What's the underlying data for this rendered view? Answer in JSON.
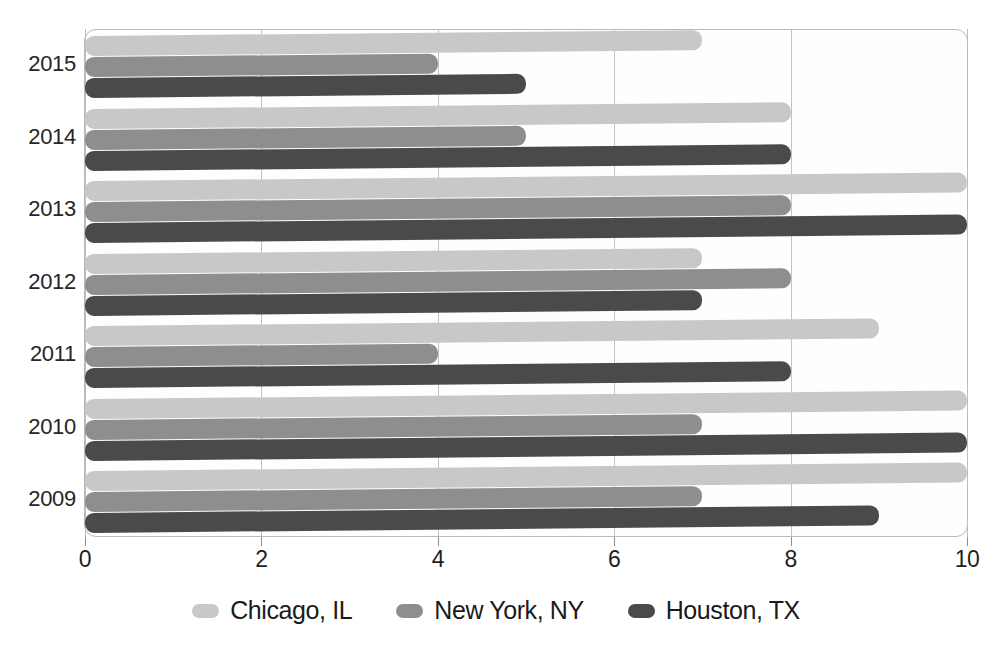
{
  "chart_data": {
    "type": "bar",
    "orientation": "horizontal",
    "title": "",
    "xlabel": "",
    "ylabel": "",
    "xlim": [
      0,
      10
    ],
    "xticks": [
      "0",
      "2",
      "4",
      "6",
      "8",
      "10"
    ],
    "grid": true,
    "legend_position": "bottom",
    "categories": [
      "2015",
      "2014",
      "2013",
      "2012",
      "2011",
      "2010",
      "2009"
    ],
    "series": [
      {
        "name": "Chicago, IL",
        "color": "#c8c8c8",
        "values": [
          7,
          8,
          10,
          7,
          9,
          10,
          10
        ]
      },
      {
        "name": "New York, NY",
        "color": "#8e8e8e",
        "values": [
          4,
          5,
          8,
          8,
          4,
          7,
          7
        ]
      },
      {
        "name": "Houston, TX",
        "color": "#4a4a4a",
        "values": [
          5,
          8,
          10,
          7,
          8,
          10,
          9
        ]
      }
    ]
  }
}
